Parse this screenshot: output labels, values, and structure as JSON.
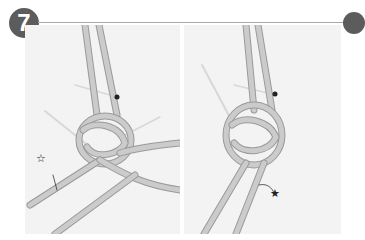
{
  "step": {
    "number": "7",
    "badge_color": "#5c5c5c",
    "rule_color": "#a8a8a8"
  },
  "photos": [
    {
      "id": "left",
      "description": "Knot of light grey rope with a pin, strand marked with outlined star",
      "marker": {
        "symbol": "☆",
        "meaning": "outlined-star-marker"
      }
    },
    {
      "id": "right",
      "description": "Tightened knot of light grey rope with a pin, strand marked with filled star",
      "marker": {
        "symbol": "★",
        "meaning": "filled-star-marker"
      }
    }
  ],
  "colors": {
    "background": "#ffffff",
    "photo_bg": "#f3f3f3",
    "rope": "#c8c8c8",
    "rope_shadow": "#9a9a9a"
  }
}
